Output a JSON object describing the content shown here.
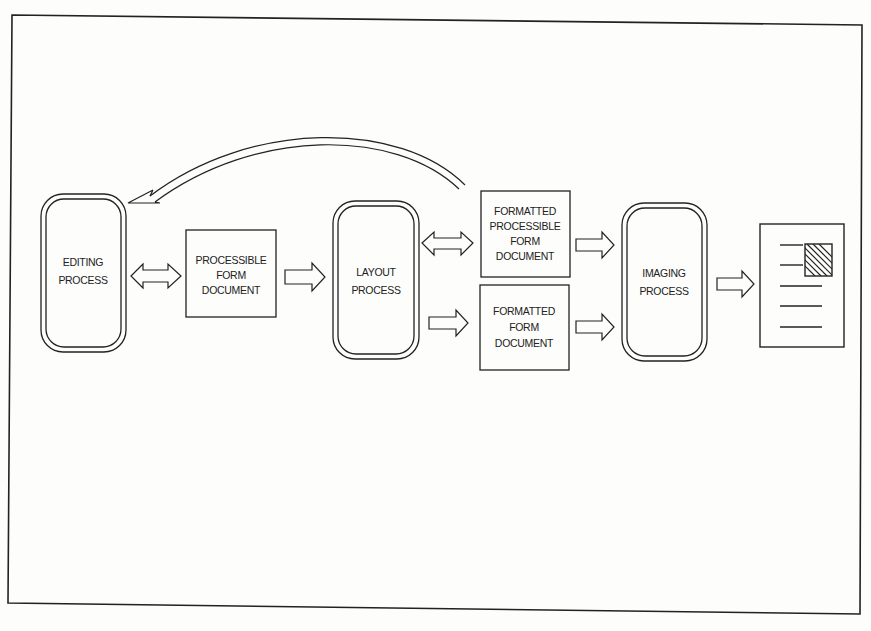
{
  "diagram": {
    "processes": {
      "editing": [
        "EDITING",
        "PROCESS"
      ],
      "layout": [
        "LAYOUT",
        "PROCESS"
      ],
      "imaging": [
        "IMAGING",
        "PROCESS"
      ]
    },
    "documents": {
      "processible": [
        "PROCESSIBLE",
        "FORM",
        "DOCUMENT"
      ],
      "formatted_processible": [
        "FORMATTED",
        "PROCESSIBLE",
        "FORM",
        "DOCUMENT"
      ],
      "formatted": [
        "FORMATTED",
        "FORM",
        "DOCUMENT"
      ]
    },
    "output_icon": "printed-page-icon",
    "colors": {
      "line": "#222222",
      "background": "#fdfdfb"
    }
  }
}
